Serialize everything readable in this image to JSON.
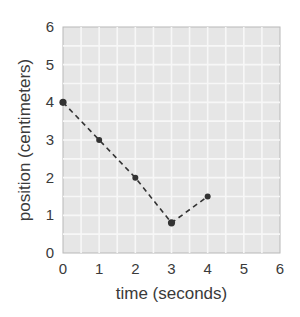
{
  "chart_data": {
    "type": "line",
    "title": "",
    "xlabel": "time (seconds)",
    "ylabel": "position (centimeters)",
    "xlim": [
      0,
      6
    ],
    "ylim": [
      0,
      6
    ],
    "x_ticks": [
      "0",
      "1",
      "2",
      "3",
      "4",
      "5",
      "6"
    ],
    "y_ticks": [
      "0",
      "1",
      "2",
      "3",
      "4",
      "5",
      "6"
    ],
    "grid": true,
    "minor_grid_step": 0.5,
    "series": [
      {
        "name": "position",
        "line_style": "dashed",
        "marker": "circle",
        "x": [
          0,
          1,
          2,
          3,
          4
        ],
        "y": [
          4,
          3,
          2,
          0.8,
          1.5
        ]
      }
    ],
    "colors": {
      "plot_background": "#e6e6e6",
      "grid": "#f7f7f7",
      "line": "#333333",
      "text": "#3a3a3a"
    }
  }
}
